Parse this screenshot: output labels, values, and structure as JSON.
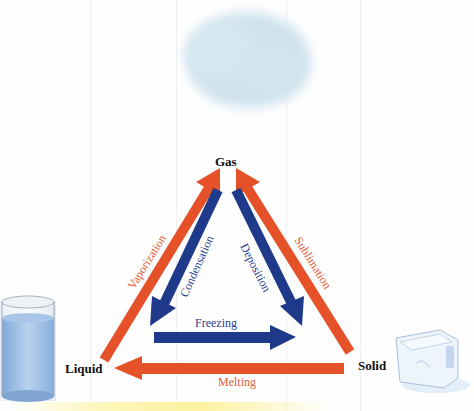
{
  "diagram": {
    "states": {
      "gas": "Gas",
      "liquid": "Liquid",
      "solid": "Solid"
    },
    "transitions": {
      "vaporization": "Vaporization",
      "condensation": "Condensation",
      "deposition": "Deposition",
      "sublimation": "Sublimation",
      "freezing": "Freezing",
      "melting": "Melting"
    },
    "images": {
      "gas": "cloud",
      "liquid": "glass-of-water",
      "solid": "ice-cube"
    },
    "colors": {
      "endothermic_arrow": "#e5522a",
      "exothermic_arrow": "#1f3a8a",
      "endothermic_text": "#e0603a",
      "exothermic_text": "#2a3f8f",
      "state_text": "#111111"
    }
  }
}
